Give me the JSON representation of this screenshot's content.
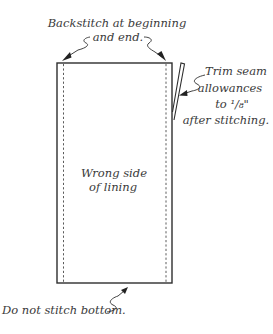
{
  "diagram": {
    "panel_label_line1": "Wrong side",
    "panel_label_line2": "of lining",
    "callouts": {
      "backstitch": {
        "line1": "Backstitch at beginning",
        "line2": "and end."
      },
      "trim": {
        "line1": "Trim seam",
        "line2": "allowances",
        "line3": "to ¹/₈\"",
        "line4": "after stitching."
      },
      "bottom": {
        "line1": "Do not stitch bottom."
      }
    },
    "colors": {
      "ink": "#2e2e2e",
      "text": "#3a3a3a",
      "background": "#ffffff"
    }
  }
}
